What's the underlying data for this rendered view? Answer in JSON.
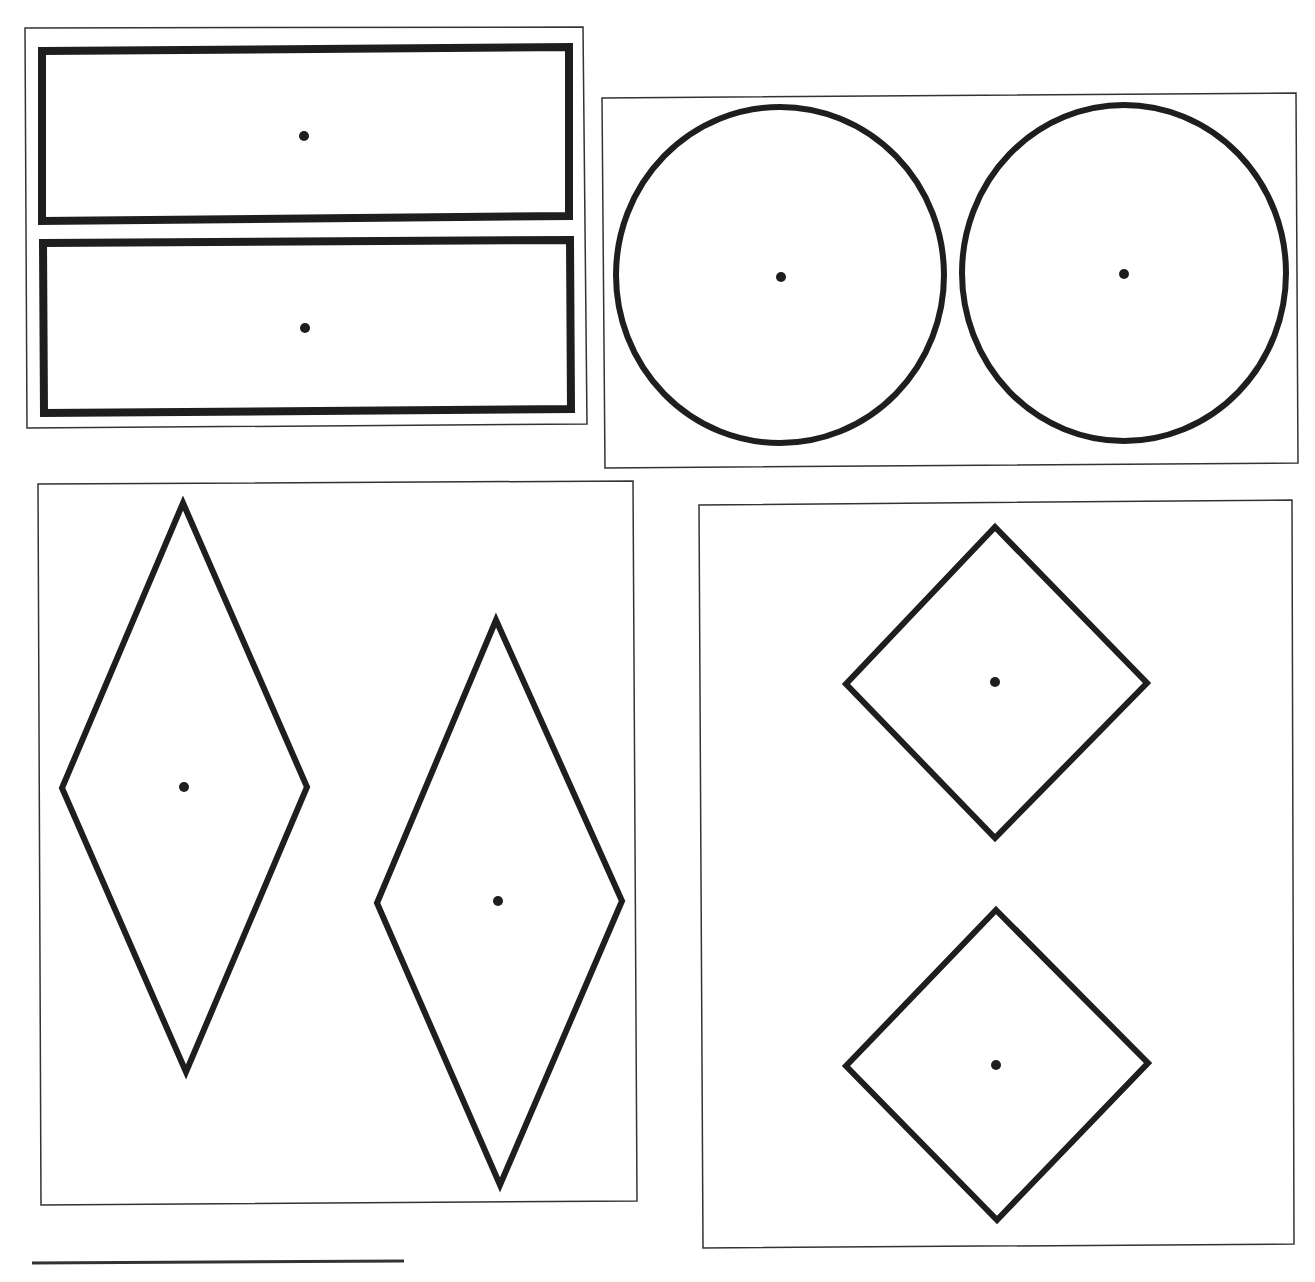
{
  "colors": {
    "background": "#ffffff",
    "stroke": "#1e1e1e",
    "frame": "#333333"
  },
  "panels": [
    {
      "name": "panel-rectangles",
      "frame": {
        "x1": 25,
        "y1": 28,
        "x2": 583,
        "y2": 27,
        "x3": 587,
        "y3": 424,
        "x4": 27,
        "y4": 428
      },
      "shapes": [
        {
          "type": "rect",
          "name": "rectangle-top",
          "points": "42,51 569,47 569,216 42,221",
          "stroke_width": 8,
          "center": [
            304,
            136
          ]
        },
        {
          "type": "rect",
          "name": "rectangle-bottom",
          "points": "43,243 570,240 571,409 44,413",
          "stroke_width": 8,
          "center": [
            305,
            328
          ]
        }
      ]
    },
    {
      "name": "panel-circles",
      "frame": {
        "x1": 602,
        "y1": 98,
        "x2": 1296,
        "y2": 93,
        "x3": 1298,
        "y3": 463,
        "x4": 605,
        "y4": 468
      },
      "shapes": [
        {
          "type": "circle",
          "name": "circle-left",
          "cx": 780,
          "cy": 275,
          "rx": 164,
          "ry": 168,
          "stroke_width": 6,
          "center": [
            781,
            277
          ]
        },
        {
          "type": "circle",
          "name": "circle-right",
          "cx": 1124,
          "cy": 273,
          "rx": 162,
          "ry": 168,
          "stroke_width": 6,
          "center": [
            1124,
            274
          ]
        }
      ]
    },
    {
      "name": "panel-tall-rhombuses",
      "frame": {
        "x1": 38,
        "y1": 484,
        "x2": 633,
        "y2": 481,
        "x3": 637,
        "y3": 1201,
        "x4": 41,
        "y4": 1205
      },
      "shapes": [
        {
          "type": "rhombus",
          "name": "rhombus-left",
          "points": "183,503 307,787 186,1072 62,788",
          "stroke_width": 6,
          "center": [
            184,
            787
          ]
        },
        {
          "type": "rhombus",
          "name": "rhombus-right",
          "points": "496,620 622,901 500,1185 377,903",
          "stroke_width": 6,
          "center": [
            498,
            901
          ]
        }
      ]
    },
    {
      "name": "panel-squares",
      "frame": {
        "x1": 699,
        "y1": 505,
        "x2": 1292,
        "y2": 500,
        "x3": 1294,
        "y3": 1244,
        "x4": 703,
        "y4": 1248
      },
      "shapes": [
        {
          "type": "square",
          "name": "diamond-square-top",
          "points": "995,527 1147,683 995,838 846,684",
          "stroke_width": 6,
          "center": [
            995,
            682
          ]
        },
        {
          "type": "square",
          "name": "diamond-square-bottom",
          "points": "996,910 1148,1063 997,1220 846,1066",
          "stroke_width": 6,
          "center": [
            996,
            1065
          ]
        }
      ]
    }
  ],
  "scale_line": {
    "x1": 32,
    "y1": 1263,
    "x2": 404,
    "y2": 1261,
    "stroke_width": 3
  }
}
